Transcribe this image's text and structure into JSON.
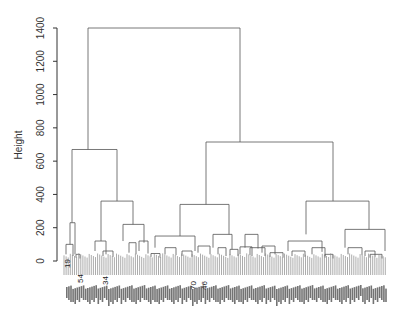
{
  "chart_data": {
    "type": "dendrogram",
    "title": "",
    "xlabel": "",
    "ylabel": "Height",
    "ylim": [
      0,
      1450
    ],
    "yticks": [
      0,
      200,
      400,
      600,
      800,
      1000,
      1200,
      1400
    ],
    "grid": false,
    "root_height": 1400,
    "merges": [
      {
        "id": "root",
        "height": 1400,
        "children": [
          "L",
          "R"
        ]
      },
      {
        "id": "L",
        "height": 670,
        "children": [
          "L1",
          "L2"
        ]
      },
      {
        "id": "L1",
        "height": 230,
        "children": [
          "L1a",
          "L1b"
        ]
      },
      {
        "id": "L1a",
        "height": 100
      },
      {
        "id": "L1b",
        "height": 40
      },
      {
        "id": "L2",
        "height": 360,
        "children": [
          "L2a",
          "L2b"
        ]
      },
      {
        "id": "L2a",
        "height": 120
      },
      {
        "id": "L2b",
        "height": 220
      },
      {
        "id": "R",
        "height": 715,
        "children": [
          "R1",
          "R2"
        ]
      },
      {
        "id": "R1",
        "height": 340,
        "children": [
          "R1a",
          "R1b"
        ]
      },
      {
        "id": "R1a",
        "height": 150
      },
      {
        "id": "R1b",
        "height": 160
      },
      {
        "id": "R2",
        "height": 360,
        "children": [
          "R2a",
          "R2b"
        ]
      },
      {
        "id": "R2a",
        "height": 160
      },
      {
        "id": "R2b",
        "height": 190
      }
    ],
    "visible_leaf_labels": [
      "19",
      "54",
      "34",
      "70",
      "46"
    ],
    "leaf_count_approx": 150
  },
  "axis": {
    "ylabel": "Height",
    "ticks": [
      "0",
      "200",
      "400",
      "600",
      "800",
      "1000",
      "1200",
      "1400"
    ]
  },
  "labels": {
    "l19": "19",
    "l54": "54",
    "l34": "34",
    "l70": "70",
    "l46": "46"
  }
}
